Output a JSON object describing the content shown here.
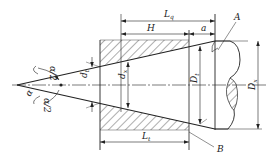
{
  "diagram": {
    "type": "taper-cone-in-bore-dimension-drawing",
    "labels": {
      "Lq": {
        "main": "L",
        "sub": "q"
      },
      "H": {
        "main": "H"
      },
      "a": {
        "main": "a"
      },
      "A": {
        "main": "A"
      },
      "B": {
        "main": "B"
      },
      "Lt": {
        "main": "L",
        "sub": "t"
      },
      "dt": {
        "main": "d",
        "sub": "t"
      },
      "dx": {
        "main": "d",
        "sub": "x"
      },
      "Dt": {
        "main": "D",
        "sub": "t"
      },
      "Dx": {
        "main": "D",
        "sub": "x"
      },
      "alpha": {
        "main": "α"
      },
      "alpha_half_top": {
        "main": "α/2"
      },
      "alpha_half_bottom": {
        "main": "α/2"
      }
    },
    "colors": {
      "line": "#222222",
      "hatch": "#333333",
      "background": "#ffffff"
    }
  }
}
